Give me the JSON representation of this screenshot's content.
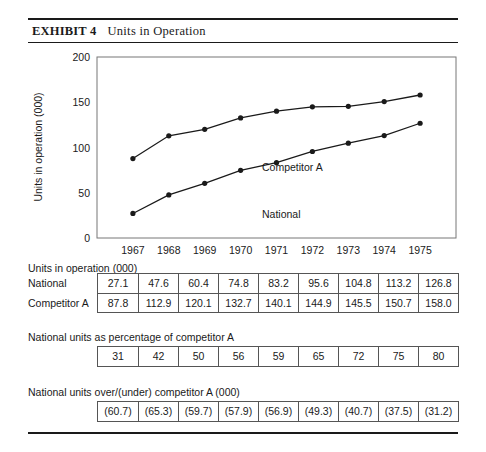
{
  "header": {
    "exhibit_label": "EXHIBIT 4",
    "title": "Units in Operation"
  },
  "chart_data": {
    "type": "line",
    "title": "Units in Operation",
    "xlabel": "",
    "ylabel": "Units in operation (000)",
    "ylim": [
      0,
      200
    ],
    "yticks": [
      0,
      50,
      100,
      150,
      200
    ],
    "grid": false,
    "legend_position": "inline-annotation",
    "categories": [
      "1967",
      "1968",
      "1969",
      "1970",
      "1971",
      "1972",
      "1973",
      "1974",
      "1975"
    ],
    "series": [
      {
        "name": "Competitor A",
        "values": [
          87.8,
          112.9,
          120.1,
          132.7,
          140.1,
          144.9,
          145.5,
          150.7,
          158.0
        ]
      },
      {
        "name": "National",
        "values": [
          27.1,
          47.6,
          60.4,
          74.8,
          83.2,
          95.6,
          104.8,
          113.2,
          126.8
        ]
      }
    ],
    "annotations": [
      "Competitor A",
      "National"
    ]
  },
  "table1": {
    "caption": "Units in operation (000)",
    "row_labels": [
      "National",
      "Competitor A"
    ],
    "rows": [
      [
        "27.1",
        "47.6",
        "60.4",
        "74.8",
        "83.2",
        "95.6",
        "104.8",
        "113.2",
        "126.8"
      ],
      [
        "87.8",
        "112.9",
        "120.1",
        "132.7",
        "140.1",
        "144.9",
        "145.5",
        "150.7",
        "158.0"
      ]
    ]
  },
  "table2": {
    "caption": "National units as percentage of competitor A",
    "rows": [
      [
        "31",
        "42",
        "50",
        "56",
        "59",
        "65",
        "72",
        "75",
        "80"
      ]
    ]
  },
  "table3": {
    "caption": "National units over/(under) competitor A (000)",
    "rows": [
      [
        "(60.7)",
        "(65.3)",
        "(59.7)",
        "(57.9)",
        "(56.9)",
        "(49.3)",
        "(40.7)",
        "(37.5)",
        "(31.2)"
      ]
    ]
  },
  "colors": {
    "ink": "#1a1a1a",
    "rule": "#555555",
    "frame": "#777777"
  }
}
